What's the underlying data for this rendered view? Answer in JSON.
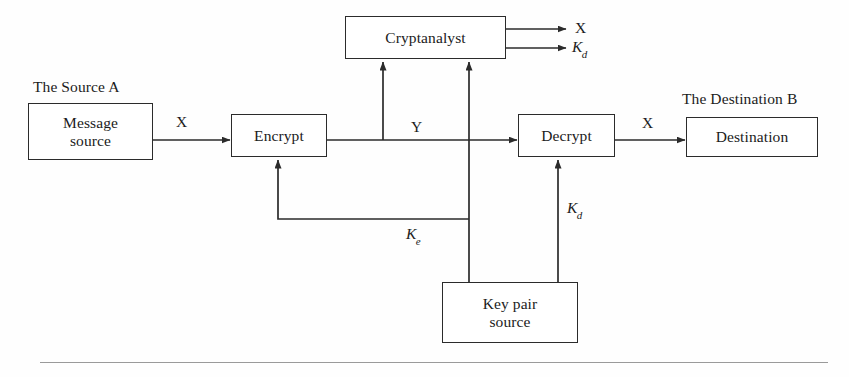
{
  "diagram": {
    "background_color": "#fefefe",
    "line_color": "#2b2b2b",
    "rule_color": "#9a9a9a",
    "nodes": [
      {
        "id": "message-source",
        "line1": "Message",
        "line2": "source",
        "x": 28,
        "y": 103,
        "w": 125,
        "h": 57
      },
      {
        "id": "encrypt",
        "line1": "Encrypt",
        "line2": "",
        "x": 231,
        "y": 114,
        "w": 96,
        "h": 43
      },
      {
        "id": "cryptanalyst",
        "line1": "Cryptanalyst",
        "line2": "",
        "x": 345,
        "y": 16,
        "w": 161,
        "h": 43
      },
      {
        "id": "decrypt",
        "line1": "Decrypt",
        "line2": "",
        "x": 518,
        "y": 114,
        "w": 97,
        "h": 43
      },
      {
        "id": "destination",
        "line1": "Destination",
        "line2": "",
        "x": 686,
        "y": 117,
        "w": 132,
        "h": 40
      },
      {
        "id": "key-pair-source",
        "line1": "Key pair",
        "line2": "source",
        "x": 442,
        "y": 282,
        "w": 136,
        "h": 61
      }
    ],
    "captions": [
      {
        "id": "source-a-caption",
        "text": "The Source A",
        "x": 33,
        "y": 78
      },
      {
        "id": "destination-b-caption",
        "text": "The Destination B",
        "x": 682,
        "y": 90
      }
    ],
    "edge_labels": [
      {
        "id": "plaintext-x-in",
        "symbol": "X",
        "subscript": "",
        "x": 176,
        "y": 113
      },
      {
        "id": "ciphertext-y",
        "symbol": "Y",
        "subscript": "",
        "x": 411,
        "y": 118
      },
      {
        "id": "plaintext-x-out",
        "symbol": "X",
        "subscript": "",
        "x": 642,
        "y": 114
      },
      {
        "id": "cryptanalyst-output-x",
        "symbol": "X",
        "subscript": "",
        "x": 575,
        "y": 19
      },
      {
        "id": "cryptanalyst-output-kd",
        "symbol": "K",
        "subscript": "d",
        "x": 572,
        "y": 38
      },
      {
        "id": "encryption-key-ke",
        "symbol": "K",
        "subscript": "e",
        "x": 406,
        "y": 225
      },
      {
        "id": "decryption-key-kd",
        "symbol": "K",
        "subscript": "d",
        "x": 567,
        "y": 199
      }
    ],
    "connections": [
      {
        "id": "message-source-to-encrypt",
        "from": "message-source",
        "to": "encrypt",
        "label": "X"
      },
      {
        "id": "encrypt-to-decrypt",
        "from": "encrypt",
        "to": "decrypt",
        "label": "Y"
      },
      {
        "id": "decrypt-to-destination",
        "from": "decrypt",
        "to": "destination",
        "label": "X"
      },
      {
        "id": "ciphertext-to-cryptanalyst",
        "from": "encrypt-to-decrypt",
        "to": "cryptanalyst",
        "label": "Y"
      },
      {
        "id": "keypair-to-cryptanalyst",
        "from": "key-pair-source",
        "to": "cryptanalyst",
        "label": ""
      },
      {
        "id": "keypair-to-encrypt",
        "from": "key-pair-source",
        "to": "encrypt",
        "label": "Ke"
      },
      {
        "id": "keypair-to-decrypt",
        "from": "key-pair-source",
        "to": "decrypt",
        "label": "Kd"
      },
      {
        "id": "cryptanalyst-out-x",
        "from": "cryptanalyst",
        "to": "cryptanalyst-output-x",
        "label": "X"
      },
      {
        "id": "cryptanalyst-out-kd",
        "from": "cryptanalyst",
        "to": "cryptanalyst-output-kd",
        "label": "Kd"
      }
    ]
  }
}
